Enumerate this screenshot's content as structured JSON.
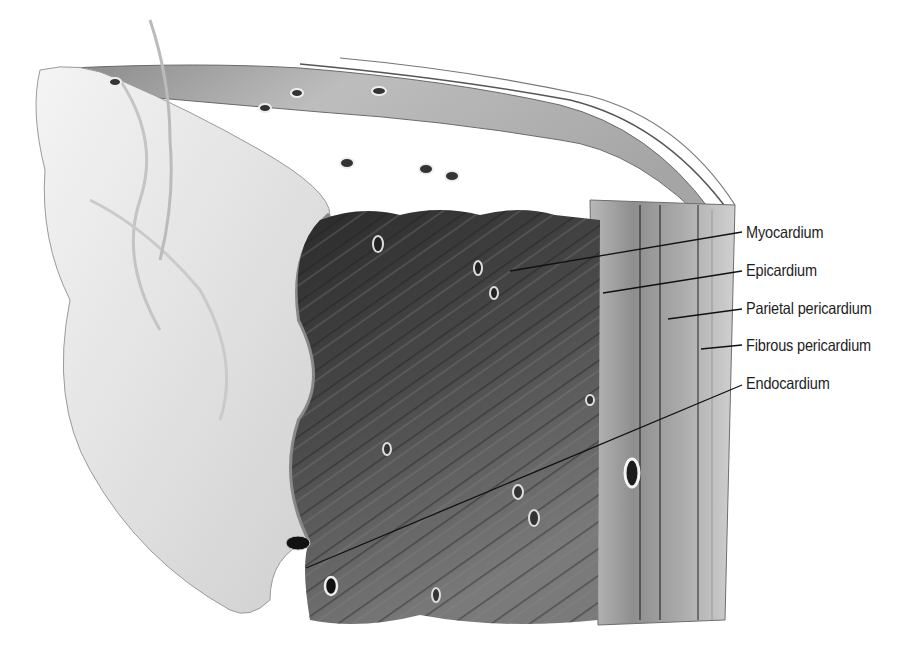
{
  "figure": {
    "style": "grayscale medical illustration",
    "colors": {
      "background": "#ffffff",
      "endocardium_surface": "#e6e6e6",
      "myocardium_dark": "#3a3a3a",
      "layer_mid": "#9a9a9a",
      "leader_line": "#111111",
      "label_text": "#1e1e1e"
    }
  },
  "labels": [
    {
      "id": "myocardium",
      "text": "Myocardium",
      "x": 746,
      "y": 224,
      "line": [
        510,
        271,
        742,
        232
      ]
    },
    {
      "id": "epicardium",
      "text": "Epicardium",
      "x": 746,
      "y": 262,
      "line": [
        603,
        293,
        742,
        271
      ]
    },
    {
      "id": "parietal-pericardium",
      "text": "Parietal pericardium",
      "x": 746,
      "y": 300,
      "line": [
        668,
        319,
        742,
        309
      ]
    },
    {
      "id": "fibrous-pericardium",
      "text": "Fibrous pericardium",
      "x": 746,
      "y": 337,
      "line": [
        701,
        349,
        742,
        345
      ]
    },
    {
      "id": "endocardium",
      "text": "Endocardium",
      "x": 746,
      "y": 375,
      "line": [
        306,
        568,
        742,
        385
      ]
    }
  ]
}
